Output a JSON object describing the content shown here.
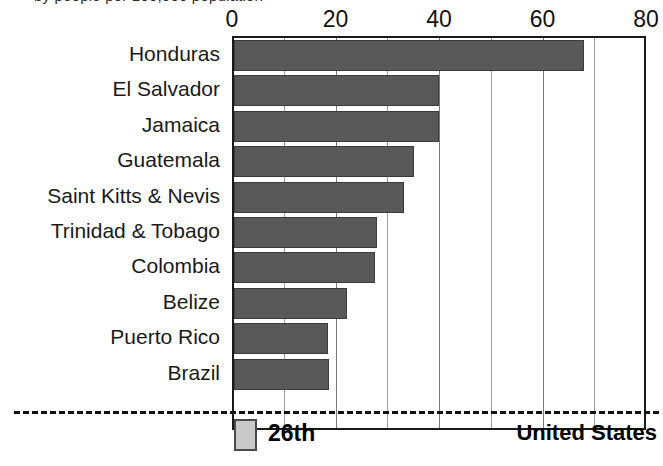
{
  "caption_fragment": "by people per 100,000 population",
  "chart_data": {
    "type": "bar",
    "orientation": "horizontal",
    "title": "",
    "subtitle": "",
    "xlabel": "",
    "ylabel": "",
    "xlim": [
      0,
      80
    ],
    "xticks": [
      0,
      20,
      40,
      60,
      80
    ],
    "xtick_labels": [
      "0",
      "20",
      "40",
      "60",
      "80"
    ],
    "gridlines": [
      10,
      20,
      30,
      40,
      50,
      60,
      70
    ],
    "grid": true,
    "legend": "none",
    "bar_color": "#595959",
    "highlight_color": "#c9c9c9",
    "categories": [
      "Honduras",
      "El Salvador",
      "Jamaica",
      "Guatemala",
      "Saint Kitts & Nevis",
      "Trinidad & Tobago",
      "Colombia",
      "Belize",
      "Puerto Rico",
      "Brazil"
    ],
    "values": [
      67.6,
      39.7,
      39.6,
      34.8,
      32.9,
      27.6,
      27.2,
      21.8,
      18.2,
      18.4
    ],
    "highlight": {
      "category": "United States",
      "value": 4.4,
      "rank_label": "26th",
      "separated_by_dashed_line": true
    }
  }
}
